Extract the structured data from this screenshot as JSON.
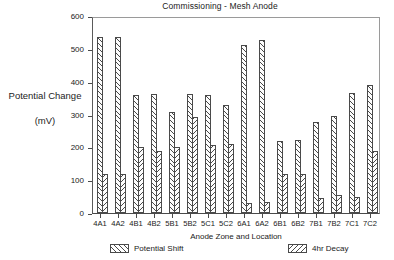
{
  "chart_data": {
    "type": "bar",
    "title": "Commissioning - Mesh Anode",
    "xlabel": "Anode Zone and Location",
    "ylabel": "Potential Change",
    "ylabel_units": "(mV)",
    "ylim": [
      0,
      600
    ],
    "yticks": [
      0,
      100,
      200,
      300,
      400,
      500,
      600
    ],
    "grid": false,
    "legend_position": "below-axis",
    "categories": [
      "4A1",
      "4A2",
      "4B1",
      "4B2",
      "5B1",
      "5B2",
      "5C1",
      "5C2",
      "6A1",
      "6A2",
      "6B1",
      "6B2",
      "7B1",
      "7B2",
      "7C1",
      "7C2"
    ],
    "series": [
      {
        "name": "Potential Shift",
        "hatch": "forward-diagonal",
        "values": [
          535,
          537,
          360,
          363,
          307,
          363,
          360,
          328,
          512,
          527,
          218,
          223,
          278,
          295,
          365,
          390
        ]
      },
      {
        "name": "4hr Decay",
        "hatch": "backward-diagonal",
        "values": [
          120,
          120,
          200,
          190,
          200,
          293,
          207,
          210,
          30,
          35,
          120,
          120,
          45,
          55,
          50,
          190
        ]
      }
    ]
  },
  "legend": {
    "items": [
      {
        "label": "Potential Shift",
        "icon": "hatch-forward-swatch"
      },
      {
        "label": "4hr Decay",
        "icon": "hatch-backward-swatch"
      }
    ]
  }
}
